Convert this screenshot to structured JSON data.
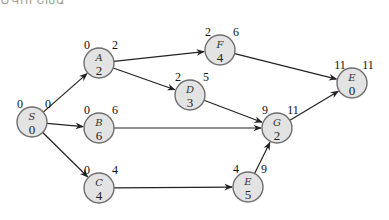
{
  "top_fragment": "ԾԿՈՒՆԽԱ",
  "nodes": [
    {
      "id": "S",
      "label": "S",
      "duration": "0",
      "early": "0",
      "late": "0",
      "cx": 32,
      "cy": 122
    },
    {
      "id": "A",
      "label": "A",
      "duration": "2",
      "early": "0",
      "late": "2",
      "cx": 99,
      "cy": 63
    },
    {
      "id": "B",
      "label": "B",
      "duration": "6",
      "early": "0",
      "late": "6",
      "cx": 99,
      "cy": 128
    },
    {
      "id": "C",
      "label": "C",
      "duration": "4",
      "early": "0",
      "late": "4",
      "cx": 99,
      "cy": 188
    },
    {
      "id": "F",
      "label": "F",
      "duration": "4",
      "early": "2",
      "late": "6",
      "cx": 220,
      "cy": 50
    },
    {
      "id": "D",
      "label": "D",
      "duration": "3",
      "early": "2",
      "late": "5",
      "cx": 190,
      "cy": 95
    },
    {
      "id": "G",
      "label": "G",
      "duration": "2",
      "early": "9",
      "late": "11",
      "cx": 277,
      "cy": 128
    },
    {
      "id": "E1",
      "label": "E",
      "duration": "0",
      "early": "11",
      "late": "11",
      "cx": 352,
      "cy": 83
    },
    {
      "id": "E2",
      "label": "E",
      "duration": "5",
      "early": "4",
      "late": "9",
      "cx": 248,
      "cy": 187
    }
  ],
  "edges": [
    {
      "from": "S",
      "to": "A"
    },
    {
      "from": "S",
      "to": "B"
    },
    {
      "from": "S",
      "to": "C"
    },
    {
      "from": "A",
      "to": "F"
    },
    {
      "from": "A",
      "to": "D"
    },
    {
      "from": "B",
      "to": "G"
    },
    {
      "from": "C",
      "to": "E2"
    },
    {
      "from": "D",
      "to": "G"
    },
    {
      "from": "E2",
      "to": "G"
    },
    {
      "from": "F",
      "to": "E1"
    },
    {
      "from": "G",
      "to": "E1"
    }
  ]
}
